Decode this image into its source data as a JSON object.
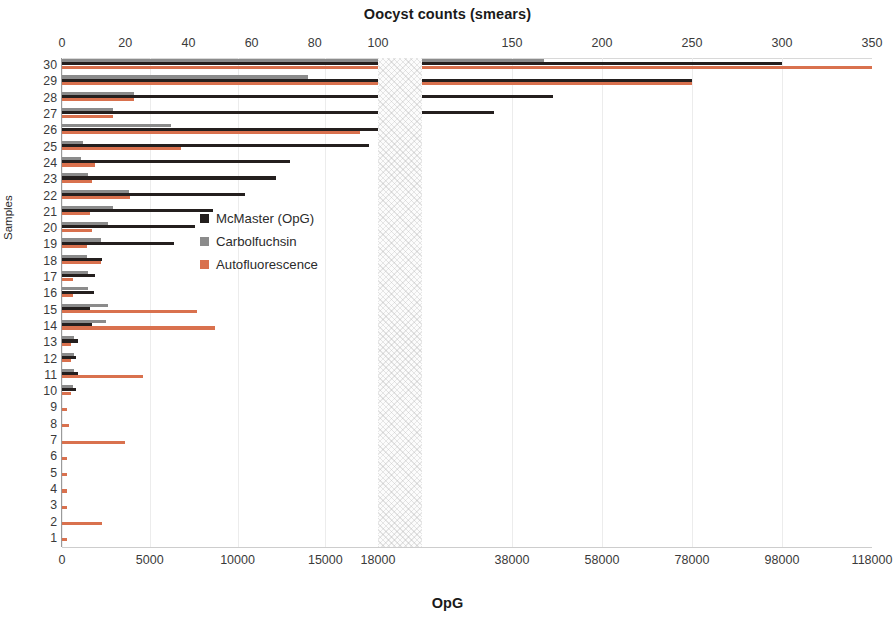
{
  "chart_data": {
    "type": "bar",
    "orientation": "horizontal",
    "title": "Oocyst counts (smears)",
    "xlabel": "OpG",
    "ylabel": "Samples",
    "grid": true,
    "legend_position": "center-left-inside",
    "axis_break": true,
    "top_axis": {
      "label": "Oocyst counts (smears)",
      "ticks": [
        0,
        20,
        40,
        60,
        80,
        100,
        150,
        200,
        250,
        300,
        350
      ],
      "tick_labels": [
        "0",
        "20",
        "40",
        "60",
        "80",
        "100",
        "150",
        "200",
        "250",
        "300",
        "350"
      ],
      "break_after": 100,
      "segment1_range": [
        0,
        100
      ],
      "segment2_range": [
        100,
        350
      ]
    },
    "bottom_axis": {
      "label": "OpG",
      "ticks": [
        0,
        5000,
        10000,
        15000,
        18000,
        38000,
        58000,
        78000,
        98000,
        118000
      ],
      "tick_labels": [
        "0",
        "5000",
        "10000",
        "15000",
        "18000",
        "38000",
        "58000",
        "78000",
        "98000",
        "118000"
      ],
      "break_after": 18000,
      "segment1_range": [
        0,
        18000
      ],
      "segment2_range": [
        18000,
        118000
      ]
    },
    "categories": [
      "30",
      "29",
      "28",
      "27",
      "26",
      "25",
      "24",
      "23",
      "22",
      "21",
      "20",
      "19",
      "18",
      "17",
      "16",
      "15",
      "14",
      "13",
      "12",
      "11",
      "10",
      "9",
      "8",
      "7",
      "6",
      "5",
      "4",
      "3",
      "2",
      "1"
    ],
    "series": [
      {
        "name": "McMaster (OpG)",
        "color": "#241f1e",
        "units": "OpG",
        "values": [
          98000,
          78000,
          47000,
          34000,
          18000,
          17500,
          13000,
          12200,
          10400,
          8600,
          7600,
          6400,
          2300,
          1900,
          1800,
          1600,
          1700,
          900,
          800,
          900,
          800,
          0,
          0,
          0,
          0,
          0,
          0,
          0,
          0,
          0
        ]
      },
      {
        "name": "Carbolfuchsin",
        "color": "#8b8b8b",
        "units": "OpG",
        "values": [
          45000,
          14000,
          4100,
          2900,
          6200,
          1200,
          1100,
          1500,
          3800,
          2900,
          2600,
          2200,
          1400,
          1500,
          1500,
          2600,
          2500,
          700,
          700,
          700,
          600,
          0,
          0,
          0,
          0,
          0,
          0,
          0,
          0,
          0
        ]
      },
      {
        "name": "Autofluorescence",
        "color": "#d9714e",
        "units": "OpG",
        "values": [
          118000,
          78000,
          4100,
          2900,
          17000,
          6800,
          1900,
          1700,
          3900,
          1600,
          1700,
          1400,
          2200,
          600,
          600,
          7700,
          8700,
          500,
          500,
          4600,
          500,
          300,
          400,
          3600,
          300,
          300,
          300,
          300,
          2300,
          300
        ]
      }
    ]
  },
  "legend": {
    "items": [
      {
        "label": "McMaster (OpG)",
        "color": "#241f1e"
      },
      {
        "label": "Carbolfuchsin",
        "color": "#8b8b8b"
      },
      {
        "label": "Autofluorescence",
        "color": "#d9714e"
      }
    ]
  }
}
